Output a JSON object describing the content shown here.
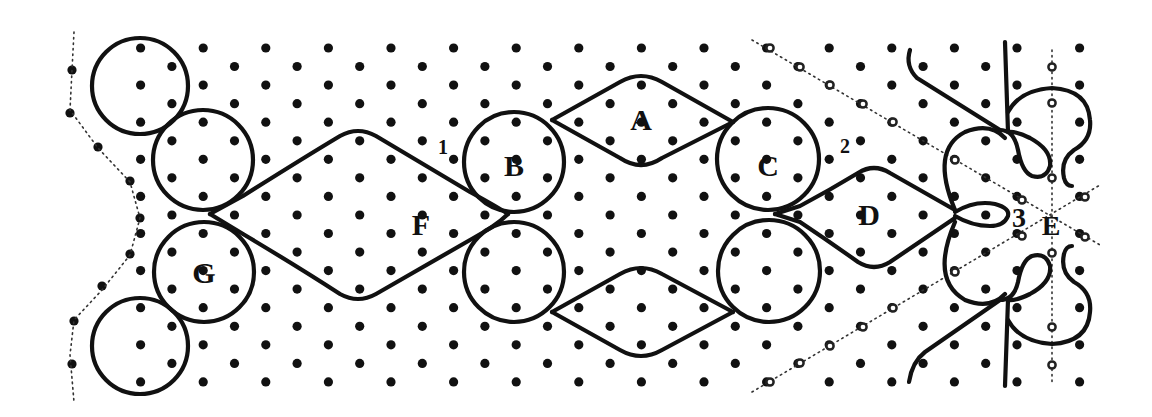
{
  "diagram": {
    "background": "#ffffff",
    "ink": "#111111",
    "labels": [
      {
        "id": "A",
        "text": "A",
        "x": 641,
        "y": 130,
        "size": 30
      },
      {
        "id": "B",
        "text": "B",
        "x": 514,
        "y": 176,
        "size": 30
      },
      {
        "id": "C",
        "text": "C",
        "x": 768,
        "y": 176,
        "size": 30
      },
      {
        "id": "D",
        "text": "D",
        "x": 869,
        "y": 225,
        "size": 30
      },
      {
        "id": "E",
        "text": "E",
        "x": 1051,
        "y": 235,
        "size": 28
      },
      {
        "id": "F",
        "text": "F",
        "x": 421,
        "y": 235,
        "size": 30
      },
      {
        "id": "G",
        "text": "G",
        "x": 204,
        "y": 283,
        "size": 30
      }
    ],
    "numbers": [
      {
        "id": "1",
        "text": "1",
        "x": 443,
        "y": 154,
        "size": 20
      },
      {
        "id": "2",
        "text": "2",
        "x": 845,
        "y": 153,
        "size": 20
      },
      {
        "id": "3",
        "text": "3",
        "x": 1019,
        "y": 227,
        "size": 28
      }
    ],
    "circles": [
      {
        "name": "top-left-outer",
        "cx": 140,
        "cy": 86,
        "r": 48
      },
      {
        "name": "top-left-inner",
        "cx": 203,
        "cy": 160,
        "r": 50
      },
      {
        "name": "circle-G",
        "cx": 204,
        "cy": 272,
        "r": 50
      },
      {
        "name": "bottom-left-outer",
        "cx": 140,
        "cy": 346,
        "r": 48
      },
      {
        "name": "circle-B",
        "cx": 514,
        "cy": 162,
        "r": 50
      },
      {
        "name": "circle-B-lower",
        "cx": 514,
        "cy": 272,
        "r": 50
      },
      {
        "name": "circle-C",
        "cx": 768,
        "cy": 159,
        "r": 51
      },
      {
        "name": "circle-C-lower",
        "cx": 769,
        "cy": 271,
        "r": 51
      }
    ],
    "threads": [
      {
        "name": "F-upper",
        "d": "M 210 214 L 243 196 Q 300 160 340 136 Q 358 126 376 136 L 470 192 Q 496 206 508 214"
      },
      {
        "name": "F-lower",
        "d": "M 210 214 L 243 234 Q 300 268 340 294 Q 358 304 376 294 L 470 240 Q 496 226 508 214"
      },
      {
        "name": "A-top-upper",
        "d": "M 552 120 L 620 82 Q 641 70 662 82 L 733 122"
      },
      {
        "name": "A-top-lower",
        "d": "M 552 120 L 620 158 Q 641 172 662 158 L 733 122"
      },
      {
        "name": "A-bottom-upper",
        "d": "M 552 312 L 620 274 Q 641 262 662 274 L 733 312"
      },
      {
        "name": "A-bottom-lower",
        "d": "M 552 312 L 620 350 Q 641 362 662 350 L 733 312"
      },
      {
        "name": "D-upper",
        "d": "M 775 214 L 800 206 Q 830 190 858 173 Q 874 163 890 173 L 955 210"
      },
      {
        "name": "D-lower",
        "d": "M 775 214 L 800 222 Q 830 242 858 262 Q 874 272 890 262 L 955 218"
      },
      {
        "name": "D-loop",
        "d": "M 955 212 Q 975 200 995 204 Q 1010 208 1008 216 Q 1004 226 990 226 Q 972 226 955 216"
      },
      {
        "name": "E-left-arc",
        "d": "M 955 210 Q 930 150 965 132 Q 990 122 1005 138"
      },
      {
        "name": "E-left-arc-lower",
        "d": "M 955 222 Q 930 280 965 300 Q 990 310 1005 294"
      },
      {
        "name": "top-pair-diag",
        "d": "M 910 50 Q 905 66 917 78 L 1000 130"
      },
      {
        "name": "top-pair-vert",
        "d": "M 1005 42 L 1008 132"
      },
      {
        "name": "top-loop",
        "d": "M 1000 130 Q 1014 130 1018 150 Q 1022 172 1032 176 Q 1046 180 1050 166 Q 1052 150 1030 138 Q 1016 131 1008 132"
      },
      {
        "name": "top-curl",
        "d": "M 1008 112 Q 1020 90 1052 88 Q 1088 90 1090 120 Q 1092 140 1074 150 Q 1060 160 1064 178 Q 1066 186 1072 186"
      },
      {
        "name": "bottom-pair-diag",
        "d": "M 909 382 Q 912 362 925 352 L 1000 300"
      },
      {
        "name": "bottom-pair-vert",
        "d": "M 1005 386 L 1008 300"
      },
      {
        "name": "bottom-loop",
        "d": "M 1000 300 Q 1014 300 1018 282 Q 1022 260 1032 256 Q 1046 252 1050 266 Q 1052 282 1030 294 Q 1016 301 1008 300"
      },
      {
        "name": "bottom-curl",
        "d": "M 1008 320 Q 1020 342 1052 344 Q 1088 342 1090 312 Q 1092 292 1074 282 Q 1060 272 1064 254 Q 1066 246 1072 246"
      }
    ],
    "guides": [
      {
        "name": "left-edge-guide",
        "d": "M 74 32 L 72 70 L 70 110 L 98 148 L 130 182 L 140 218 L 130 255 L 102 290 L 74 320 L 70 355 L 74 402"
      },
      {
        "name": "diag-down",
        "d": "M 752 40 L 1100 245"
      },
      {
        "name": "diag-up",
        "d": "M 752 392 L 1100 185"
      },
      {
        "name": "E-vertical",
        "d": "M 1052 50 L 1052 382"
      }
    ],
    "grid": {
      "x0": 78,
      "dx": 62.6,
      "y0": 48,
      "dy": 18.55,
      "rows": 19,
      "cols": 17,
      "xmin": 78,
      "xmax": 1090,
      "dot_r": 4.6
    },
    "extra_pins": [
      {
        "x": 72,
        "y": 70
      },
      {
        "x": 70,
        "y": 113
      },
      {
        "x": 98,
        "y": 147
      },
      {
        "x": 130,
        "y": 181
      },
      {
        "x": 140,
        "y": 218
      },
      {
        "x": 130,
        "y": 254
      },
      {
        "x": 102,
        "y": 286
      },
      {
        "x": 74,
        "y": 321
      },
      {
        "x": 72,
        "y": 364
      }
    ],
    "hollow_pins": [
      {
        "x": 1052,
        "y": 67
      },
      {
        "x": 1052,
        "y": 103
      },
      {
        "x": 1052,
        "y": 178
      },
      {
        "x": 1052,
        "y": 253
      },
      {
        "x": 1052,
        "y": 327
      },
      {
        "x": 1052,
        "y": 365
      },
      {
        "x": 770,
        "y": 48
      },
      {
        "x": 800,
        "y": 67
      },
      {
        "x": 830,
        "y": 85
      },
      {
        "x": 863,
        "y": 104
      },
      {
        "x": 893,
        "y": 122
      },
      {
        "x": 955,
        "y": 160
      },
      {
        "x": 1022,
        "y": 200
      },
      {
        "x": 1085,
        "y": 237
      },
      {
        "x": 770,
        "y": 382
      },
      {
        "x": 800,
        "y": 363
      },
      {
        "x": 830,
        "y": 346
      },
      {
        "x": 863,
        "y": 327
      },
      {
        "x": 893,
        "y": 308
      },
      {
        "x": 955,
        "y": 272
      },
      {
        "x": 1022,
        "y": 236
      },
      {
        "x": 1085,
        "y": 197
      }
    ]
  }
}
